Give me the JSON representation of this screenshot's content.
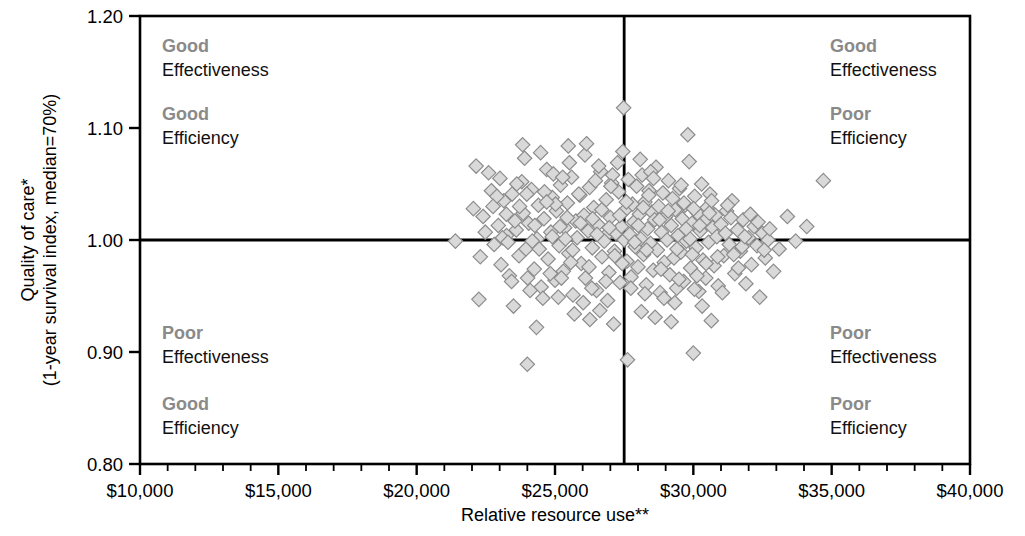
{
  "chart_data": {
    "type": "scatter",
    "title": "",
    "xlabel": "Relative resource use**",
    "ylabel_line1": "Quality of care*",
    "ylabel_line2": "(1-year survival index, median=70%)",
    "xlim": [
      10000,
      40000
    ],
    "ylim": [
      0.8,
      1.2
    ],
    "x_ticks": [
      10000,
      15000,
      20000,
      25000,
      30000,
      35000,
      40000
    ],
    "x_tick_labels": [
      "$10,000",
      "$15,000",
      "$20,000",
      "$25,000",
      "$30,000",
      "$35,000",
      "$40,000"
    ],
    "x_minor_tick_step": 1000,
    "y_ticks": [
      0.8,
      0.9,
      1.0,
      1.1,
      1.2
    ],
    "y_tick_labels": [
      "0.80",
      "0.90",
      "1.00",
      "1.10",
      "1.20"
    ],
    "grid": false,
    "legend": "none",
    "marker": "diamond",
    "marker_fill": "#d9d9d9",
    "marker_stroke": "#8c8c8c",
    "reference_lines": {
      "vertical_x": 27500,
      "horizontal_y": 1.0,
      "color": "#000000"
    },
    "points": [
      [
        21400,
        0.999
      ],
      [
        22050,
        1.028
      ],
      [
        22150,
        1.066
      ],
      [
        22250,
        0.947
      ],
      [
        22400,
        1.021
      ],
      [
        22600,
        1.06
      ],
      [
        22800,
        0.996
      ],
      [
        22950,
        1.013
      ],
      [
        23050,
        0.978
      ],
      [
        23150,
        1.035
      ],
      [
        23250,
        1.004
      ],
      [
        23350,
        0.968
      ],
      [
        23450,
        1.041
      ],
      [
        23500,
        0.941
      ],
      [
        23600,
        1.009
      ],
      [
        23700,
        0.986
      ],
      [
        23800,
        1.052
      ],
      [
        23850,
        1.024
      ],
      [
        23950,
        0.992
      ],
      [
        24000,
        0.889
      ],
      [
        24050,
        1.015
      ],
      [
        24150,
        1.045
      ],
      [
        24250,
        0.974
      ],
      [
        24350,
        1.001
      ],
      [
        24400,
        1.031
      ],
      [
        24500,
        0.958
      ],
      [
        24600,
        1.019
      ],
      [
        24700,
        1.063
      ],
      [
        24750,
        0.983
      ],
      [
        24850,
        1.007
      ],
      [
        24900,
        1.038
      ],
      [
        25000,
        0.964
      ],
      [
        25050,
        1.026
      ],
      [
        25150,
        0.995
      ],
      [
        25200,
        1.049
      ],
      [
        25300,
        0.972
      ],
      [
        25350,
        1.011
      ],
      [
        25450,
        1.033
      ],
      [
        25500,
        0.988
      ],
      [
        25600,
        1.056
      ],
      [
        25650,
        0.951
      ],
      [
        25750,
        1.017
      ],
      [
        25800,
        1.002
      ],
      [
        25900,
        1.04
      ],
      [
        25950,
        0.979
      ],
      [
        26050,
        1.022
      ],
      [
        26100,
        0.966
      ],
      [
        26200,
        1.008
      ],
      [
        26250,
        1.047
      ],
      [
        26350,
        0.993
      ],
      [
        26400,
        1.029
      ],
      [
        26500,
        0.955
      ],
      [
        26550,
        1.014
      ],
      [
        26650,
        1.061
      ],
      [
        26700,
        0.985
      ],
      [
        26800,
        1.003
      ],
      [
        26850,
        1.036
      ],
      [
        26950,
        0.971
      ],
      [
        27000,
        1.02
      ],
      [
        27050,
        1.051
      ],
      [
        27150,
        0.99
      ],
      [
        27200,
        1.006
      ],
      [
        27300,
        1.043
      ],
      [
        27350,
        0.962
      ],
      [
        27400,
        1.012
      ],
      [
        27450,
        1.079
      ],
      [
        27480,
        1.118
      ],
      [
        27500,
        1.0
      ],
      [
        27550,
        1.027
      ],
      [
        27600,
        0.981
      ],
      [
        27650,
        1.054
      ],
      [
        27700,
        1.005
      ],
      [
        27750,
        0.967
      ],
      [
        27800,
        1.032
      ],
      [
        27850,
        1.016
      ],
      [
        27900,
        0.994
      ],
      [
        27950,
        1.048
      ],
      [
        28000,
        0.976
      ],
      [
        28050,
        1.023
      ],
      [
        28100,
        1.001
      ],
      [
        28150,
        1.058
      ],
      [
        28200,
        0.987
      ],
      [
        28250,
        1.034
      ],
      [
        28300,
        0.96
      ],
      [
        28350,
        1.01
      ],
      [
        28400,
        1.044
      ],
      [
        28450,
        0.997
      ],
      [
        28500,
        1.025
      ],
      [
        28550,
        0.973
      ],
      [
        28600,
        1.018
      ],
      [
        28650,
        1.065
      ],
      [
        28700,
        0.991
      ],
      [
        28750,
        1.03
      ],
      [
        28800,
        0.953
      ],
      [
        28850,
        1.007
      ],
      [
        28900,
        1.042
      ],
      [
        28950,
        0.98
      ],
      [
        29000,
        1.021
      ],
      [
        29050,
        1.0
      ],
      [
        29100,
        1.053
      ],
      [
        29150,
        0.969
      ],
      [
        29200,
        1.013
      ],
      [
        29250,
        1.037
      ],
      [
        29300,
        0.984
      ],
      [
        29350,
        1.027
      ],
      [
        29400,
        0.957
      ],
      [
        29450,
        1.004
      ],
      [
        29500,
        1.046
      ],
      [
        29550,
        0.989
      ],
      [
        29600,
        1.019
      ],
      [
        29650,
        0.963
      ],
      [
        29700,
        1.031
      ],
      [
        29750,
        0.999
      ],
      [
        29800,
        1.094
      ],
      [
        29850,
        1.07
      ],
      [
        29900,
        0.975
      ],
      [
        29950,
        1.015
      ],
      [
        30000,
        0.899
      ],
      [
        30050,
        1.039
      ],
      [
        30100,
        0.993
      ],
      [
        30150,
        1.024
      ],
      [
        30200,
        0.954
      ],
      [
        30250,
        1.008
      ],
      [
        30300,
        1.05
      ],
      [
        30350,
        0.982
      ],
      [
        30400,
        1.017
      ],
      [
        30450,
        0.966
      ],
      [
        30500,
        1.029
      ],
      [
        30550,
        0.998
      ],
      [
        30600,
        1.041
      ],
      [
        30650,
        0.928
      ],
      [
        30700,
        1.011
      ],
      [
        30750,
        0.977
      ],
      [
        30800,
        1.022
      ],
      [
        30850,
        1.003
      ],
      [
        30900,
        0.959
      ],
      [
        31000,
        1.014
      ],
      [
        31100,
        0.986
      ],
      [
        31200,
        1.026
      ],
      [
        31300,
        0.996
      ],
      [
        31400,
        1.035
      ],
      [
        31500,
        0.97
      ],
      [
        31600,
        1.009
      ],
      [
        31700,
        0.99
      ],
      [
        31800,
        1.018
      ],
      [
        31900,
        0.961
      ],
      [
        32000,
        1.002
      ],
      [
        32100,
        0.978
      ],
      [
        32200,
        1.012
      ],
      [
        32300,
        0.995
      ],
      [
        32400,
        0.949
      ],
      [
        32500,
        1.006
      ],
      [
        32600,
        0.984
      ],
      [
        32700,
        1.0
      ],
      [
        32900,
        0.972
      ],
      [
        33100,
        0.992
      ],
      [
        33400,
        1.021
      ],
      [
        33700,
        0.999
      ],
      [
        34100,
        1.012
      ],
      [
        34700,
        1.053
      ],
      [
        23100,
        1.002
      ],
      [
        23550,
        1.017
      ],
      [
        24180,
        0.999
      ],
      [
        24620,
        1.043
      ],
      [
        25120,
        0.949
      ],
      [
        25520,
        1.069
      ],
      [
        26020,
        0.944
      ],
      [
        26620,
        0.937
      ],
      [
        27120,
        0.925
      ],
      [
        27620,
        0.893
      ],
      [
        28120,
        0.936
      ],
      [
        28620,
        0.931
      ],
      [
        24330,
        0.922
      ],
      [
        25230,
        0.966
      ],
      [
        26330,
        0.957
      ],
      [
        29330,
        0.944
      ],
      [
        22700,
        1.044
      ],
      [
        23900,
        1.073
      ],
      [
        24480,
        1.078
      ],
      [
        25480,
        1.084
      ],
      [
        26080,
        1.076
      ],
      [
        26580,
        1.066
      ],
      [
        27080,
        1.058
      ],
      [
        28080,
        1.072
      ],
      [
        23300,
        0.998
      ],
      [
        24100,
        0.955
      ],
      [
        25700,
        0.934
      ],
      [
        26900,
        0.946
      ],
      [
        28250,
        0.952
      ],
      [
        29480,
        0.965
      ],
      [
        30320,
        0.941
      ],
      [
        31050,
        0.953
      ],
      [
        22900,
        1.039
      ],
      [
        23720,
        1.03
      ],
      [
        24940,
        1.059
      ],
      [
        25860,
        1.041
      ],
      [
        26460,
        1.053
      ],
      [
        27260,
        1.069
      ],
      [
        28460,
        1.061
      ],
      [
        29660,
        1.033
      ],
      [
        30660,
        1.035
      ],
      [
        31360,
        1.02
      ],
      [
        32060,
        1.023
      ],
      [
        32760,
        1.01
      ],
      [
        25380,
        1.001
      ],
      [
        26780,
        0.999
      ],
      [
        27880,
        0.998
      ],
      [
        29880,
        1.001
      ],
      [
        23430,
        0.963
      ],
      [
        24830,
        0.97
      ],
      [
        26230,
        0.976
      ],
      [
        27430,
        0.979
      ],
      [
        28830,
        0.974
      ],
      [
        30130,
        0.968
      ],
      [
        31630,
        0.975
      ],
      [
        22480,
        1.007
      ],
      [
        23620,
        1.05
      ],
      [
        24270,
        1.013
      ],
      [
        25020,
        1.032
      ],
      [
        25920,
        1.015
      ],
      [
        26690,
        1.027
      ],
      [
        27340,
        1.022
      ],
      [
        28390,
        1.04
      ],
      [
        29090,
        1.026
      ],
      [
        30230,
        1.013
      ],
      [
        31160,
        1.006
      ],
      [
        24430,
        0.992
      ],
      [
        25570,
        0.98
      ],
      [
        26840,
        0.963
      ],
      [
        27740,
        0.957
      ],
      [
        28940,
        0.948
      ],
      [
        30040,
        0.956
      ],
      [
        23830,
        1.085
      ],
      [
        25280,
        1.056
      ],
      [
        26140,
        1.086
      ],
      [
        27020,
        1.048
      ],
      [
        28560,
        1.055
      ],
      [
        29560,
        1.049
      ],
      [
        30580,
        1.024
      ],
      [
        22300,
        0.985
      ],
      [
        23240,
        1.023
      ],
      [
        24700,
        1.034
      ],
      [
        26360,
        1.019
      ],
      [
        28190,
        1.029
      ],
      [
        29740,
        1.01
      ],
      [
        31760,
        0.994
      ],
      [
        24560,
        0.948
      ],
      [
        26260,
        0.929
      ],
      [
        29200,
        0.927
      ],
      [
        30880,
        0.985
      ],
      [
        32340,
        1.016
      ],
      [
        23010,
        1.055
      ],
      [
        24900,
        1.003
      ],
      [
        25440,
        1.02
      ],
      [
        27160,
        0.986
      ],
      [
        28310,
        0.991
      ],
      [
        29410,
        0.992
      ],
      [
        30460,
        0.979
      ],
      [
        31460,
        0.987
      ],
      [
        22760,
        1.03
      ],
      [
        23980,
        1.041
      ],
      [
        25180,
        1.012
      ],
      [
        26520,
        1.005
      ],
      [
        27580,
        1.034
      ],
      [
        28780,
        1.018
      ],
      [
        30010,
        1.028
      ],
      [
        31240,
        1.031
      ],
      [
        32560,
        0.991
      ],
      [
        24010,
        0.966
      ],
      [
        25640,
        0.991
      ],
      [
        26960,
        1.011
      ],
      [
        28010,
        1.013
      ],
      [
        29960,
        0.987
      ],
      [
        31860,
        1.003
      ]
    ]
  },
  "quadrants": [
    {
      "position": "top-left",
      "effectiveness_rating": "Good",
      "effectiveness_label": "Effectiveness",
      "efficiency_rating": "Good",
      "efficiency_label": "Efficiency"
    },
    {
      "position": "top-right",
      "effectiveness_rating": "Good",
      "effectiveness_label": "Effectiveness",
      "efficiency_rating": "Poor",
      "efficiency_label": "Efficiency"
    },
    {
      "position": "bottom-left",
      "effectiveness_rating": "Poor",
      "effectiveness_label": "Effectiveness",
      "efficiency_rating": "Good",
      "efficiency_label": "Efficiency"
    },
    {
      "position": "bottom-right",
      "effectiveness_rating": "Poor",
      "effectiveness_label": "Effectiveness",
      "efficiency_rating": "Poor",
      "efficiency_label": "Efficiency"
    }
  ]
}
